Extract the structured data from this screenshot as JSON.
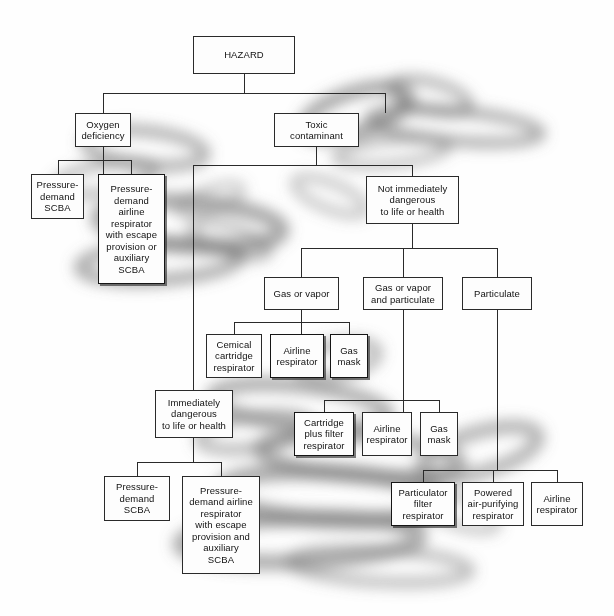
{
  "diagram": {
    "title": "HAZARD",
    "type": "decision-tree-flowchart",
    "colors": {
      "box_fill": "#fdfdfd",
      "box_border": "#2a2a2a",
      "line": "#2a2a2a",
      "text": "#111111",
      "page_background": "#fefefe",
      "smudge": "#6f6f6f"
    },
    "nodes": [
      {
        "id": "hazard",
        "label": "HAZARD",
        "x": 193,
        "y": 36,
        "w": 102,
        "h": 38,
        "heavy": false
      },
      {
        "id": "oxygen",
        "label": "Oxygen\ndeficiency",
        "x": 75,
        "y": 113,
        "w": 56,
        "h": 34,
        "heavy": false
      },
      {
        "id": "toxic",
        "label": "Toxic\ncontaminant",
        "x": 274,
        "y": 113,
        "w": 85,
        "h": 34,
        "heavy": false
      },
      {
        "id": "pd-scba-1",
        "label": "Pressure-\ndemand\nSCBA",
        "x": 31,
        "y": 174,
        "w": 53,
        "h": 45,
        "heavy": false
      },
      {
        "id": "pd-airline-1",
        "label": "Pressure-\ndemand\nairline\nrespirator\nwith escape\nprovision or\nauxiliary\nSCBA",
        "x": 98,
        "y": 174,
        "w": 67,
        "h": 110,
        "heavy": true
      },
      {
        "id": "not-idlh",
        "label": "Not immediately\ndangerous\nto life or health",
        "x": 366,
        "y": 176,
        "w": 93,
        "h": 48,
        "heavy": false
      },
      {
        "id": "gas-vapor",
        "label": "Gas or vapor",
        "x": 264,
        "y": 277,
        "w": 75,
        "h": 33,
        "heavy": false
      },
      {
        "id": "gas-vapor-part",
        "label": "Gas or vapor\nand particulate",
        "x": 363,
        "y": 277,
        "w": 80,
        "h": 33,
        "heavy": false
      },
      {
        "id": "particulate",
        "label": "Particulate",
        "x": 462,
        "y": 277,
        "w": 70,
        "h": 33,
        "heavy": false
      },
      {
        "id": "chem-cart",
        "label": "Cemical\ncartridge\nrespirator",
        "x": 206,
        "y": 334,
        "w": 56,
        "h": 44,
        "heavy": false
      },
      {
        "id": "airline-1",
        "label": "Airline\nrespirator",
        "x": 270,
        "y": 334,
        "w": 54,
        "h": 44,
        "heavy": true
      },
      {
        "id": "gas-mask-1",
        "label": "Gas\nmask",
        "x": 330,
        "y": 334,
        "w": 38,
        "h": 44,
        "heavy": true
      },
      {
        "id": "idlh",
        "label": "Immediately\ndangerous\nto life or health",
        "x": 155,
        "y": 390,
        "w": 78,
        "h": 48,
        "heavy": false
      },
      {
        "id": "cart-filter",
        "label": "Cartridge\nplus filter\nrespirator",
        "x": 294,
        "y": 412,
        "w": 60,
        "h": 44,
        "heavy": true
      },
      {
        "id": "airline-2",
        "label": "Airline\nrespirator",
        "x": 362,
        "y": 412,
        "w": 50,
        "h": 44,
        "heavy": false
      },
      {
        "id": "gas-mask-2",
        "label": "Gas\nmask",
        "x": 420,
        "y": 412,
        "w": 38,
        "h": 44,
        "heavy": false
      },
      {
        "id": "pd-scba-2",
        "label": "Pressure-\ndemand\nSCBA",
        "x": 104,
        "y": 476,
        "w": 66,
        "h": 45,
        "heavy": false
      },
      {
        "id": "pd-airline-2",
        "label": "Pressure-\ndemand airline\nrespirator\nwith escape\nprovision and\nauxiliary\nSCBA",
        "x": 182,
        "y": 476,
        "w": 78,
        "h": 98,
        "heavy": false
      },
      {
        "id": "part-filter",
        "label": "Particulator\nfilter\nrespirator",
        "x": 391,
        "y": 482,
        "w": 64,
        "h": 44,
        "heavy": true
      },
      {
        "id": "powered-apr",
        "label": "Powered\nair-purifying\nrespirator",
        "x": 462,
        "y": 482,
        "w": 62,
        "h": 44,
        "heavy": false
      },
      {
        "id": "airline-3",
        "label": "Airline\nrespirator",
        "x": 531,
        "y": 482,
        "w": 52,
        "h": 44,
        "heavy": false
      }
    ],
    "connections": [
      {
        "from": "hazard",
        "to": [
          "oxygen",
          "toxic"
        ]
      },
      {
        "from": "oxygen",
        "to": [
          "pd-scba-1",
          "pd-airline-1"
        ]
      },
      {
        "from": "toxic",
        "to": [
          "idlh",
          "not-idlh"
        ]
      },
      {
        "from": "not-idlh",
        "to": [
          "gas-vapor",
          "gas-vapor-part",
          "particulate"
        ]
      },
      {
        "from": "gas-vapor",
        "to": [
          "chem-cart",
          "airline-1",
          "gas-mask-1"
        ]
      },
      {
        "from": "gas-vapor-part",
        "to": [
          "cart-filter",
          "airline-2",
          "gas-mask-2"
        ]
      },
      {
        "from": "particulate",
        "to": [
          "part-filter",
          "powered-apr",
          "airline-3"
        ]
      },
      {
        "from": "idlh",
        "to": [
          "pd-scba-2",
          "pd-airline-2"
        ]
      }
    ],
    "edge_paths": [
      "M244,74 L244,93",
      "M103,93 L385,93",
      "M103,93 L103,113",
      "M385,93 L385,113",
      "M103,147 L103,174",
      "M58,160 L131,160",
      "M58,160 L58,174",
      "M131,160 L131,174",
      "M316,147 L316,165",
      "M193,165 L412,165",
      "M193,165 L193,390",
      "M412,165 L412,176",
      "M412,224 L412,248",
      "M301,248 L497,248",
      "M301,248 L301,277",
      "M403,248 L403,277",
      "M497,248 L497,277",
      "M301,310 L301,334",
      "M234,322 L349,322",
      "M234,322 L234,334",
      "M349,322 L349,334",
      "M403,310 L403,400",
      "M324,400 L439,400",
      "M324,400 L324,412",
      "M439,400 L439,412",
      "M403,400 L403,412",
      "M497,310 L497,470",
      "M423,470 L557,470",
      "M423,470 L423,482",
      "M493,470 L493,482",
      "M557,470 L557,482",
      "M193,438 L193,462",
      "M137,462 L221,462",
      "M137,462 L137,476",
      "M221,462 L221,476"
    ],
    "smudges": [
      {
        "cx": 356,
        "cy": 112,
        "rx": 54,
        "ry": 20,
        "rot": -18,
        "op": 0.62,
        "blur": 9
      },
      {
        "cx": 430,
        "cy": 96,
        "rx": 40,
        "ry": 14,
        "rot": 14,
        "op": 0.55,
        "blur": 9
      },
      {
        "cx": 455,
        "cy": 126,
        "rx": 86,
        "ry": 15,
        "rot": 5,
        "op": 0.6,
        "blur": 10
      },
      {
        "cx": 392,
        "cy": 152,
        "rx": 56,
        "ry": 12,
        "rot": -6,
        "op": 0.5,
        "blur": 9
      },
      {
        "cx": 330,
        "cy": 196,
        "rx": 38,
        "ry": 13,
        "rot": 22,
        "op": 0.42,
        "blur": 10
      },
      {
        "cx": 145,
        "cy": 148,
        "rx": 60,
        "ry": 17,
        "rot": 6,
        "op": 0.55,
        "blur": 10
      },
      {
        "cx": 105,
        "cy": 178,
        "rx": 50,
        "ry": 14,
        "rot": -10,
        "op": 0.5,
        "blur": 9
      },
      {
        "cx": 190,
        "cy": 224,
        "rx": 92,
        "ry": 22,
        "rot": 4,
        "op": 0.62,
        "blur": 11
      },
      {
        "cx": 160,
        "cy": 262,
        "rx": 80,
        "ry": 18,
        "rot": -4,
        "op": 0.58,
        "blur": 11
      },
      {
        "cx": 230,
        "cy": 240,
        "rx": 40,
        "ry": 13,
        "rot": 18,
        "op": 0.45,
        "blur": 10
      },
      {
        "cx": 338,
        "cy": 360,
        "rx": 40,
        "ry": 16,
        "rot": -12,
        "op": 0.5,
        "blur": 10
      },
      {
        "cx": 300,
        "cy": 406,
        "rx": 88,
        "ry": 20,
        "rot": 6,
        "op": 0.58,
        "blur": 11
      },
      {
        "cx": 255,
        "cy": 432,
        "rx": 56,
        "ry": 16,
        "rot": -8,
        "op": 0.5,
        "blur": 10
      },
      {
        "cx": 360,
        "cy": 456,
        "rx": 100,
        "ry": 20,
        "rot": 4,
        "op": 0.58,
        "blur": 11
      },
      {
        "cx": 480,
        "cy": 452,
        "rx": 60,
        "ry": 20,
        "rot": -16,
        "op": 0.52,
        "blur": 10
      },
      {
        "cx": 330,
        "cy": 496,
        "rx": 110,
        "ry": 24,
        "rot": 3,
        "op": 0.6,
        "blur": 12
      },
      {
        "cx": 300,
        "cy": 540,
        "rx": 120,
        "ry": 22,
        "rot": -2,
        "op": 0.58,
        "blur": 12
      },
      {
        "cx": 380,
        "cy": 566,
        "rx": 90,
        "ry": 16,
        "rot": 3,
        "op": 0.45,
        "blur": 11
      },
      {
        "cx": 455,
        "cy": 510,
        "rx": 44,
        "ry": 14,
        "rot": 20,
        "op": 0.4,
        "blur": 10
      },
      {
        "cx": 210,
        "cy": 200,
        "rx": 34,
        "ry": 11,
        "rot": -20,
        "op": 0.4,
        "blur": 9
      }
    ]
  }
}
